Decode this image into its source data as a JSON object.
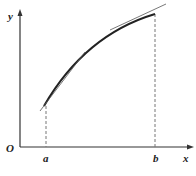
{
  "diagram": {
    "axes": {
      "x_label": "x",
      "y_label": "y",
      "origin_label": "O"
    },
    "points": {
      "a_label": "a",
      "b_label": "b"
    },
    "colors": {
      "stroke": "#222222",
      "thin": "#555555",
      "dash": "#777777"
    }
  }
}
